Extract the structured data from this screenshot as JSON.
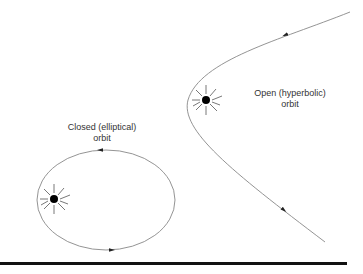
{
  "diagram": {
    "type": "orbit-comparison",
    "colors": {
      "line": "#888888",
      "body": "#000000",
      "rule": "#111111",
      "background": "#ffffff"
    },
    "closed_orbit": {
      "label_line1": "Closed (elliptical)",
      "label_line2": "orbit",
      "shape": "ellipse",
      "direction": "counterclockwise",
      "central_body_icon": "sun-icon"
    },
    "open_orbit": {
      "label_line1": "Open (hyperbolic)",
      "label_line2": "orbit",
      "shape": "hyperbola",
      "direction": "inbound-upper-right-to-outbound-lower-right",
      "central_body_icon": "sun-icon"
    }
  }
}
